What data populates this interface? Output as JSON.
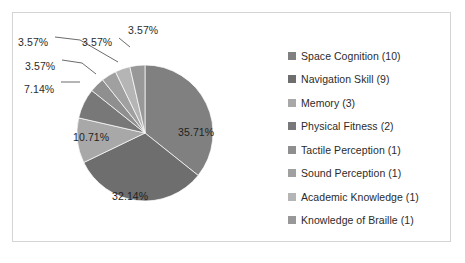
{
  "chart_data": {
    "type": "pie",
    "title": "",
    "subtitle": "",
    "xlabel": "",
    "ylabel": "",
    "legend_position": "right",
    "grid": false,
    "categories": [
      "Space Cognition",
      "Navigation Skill",
      "Memory",
      "Physical Fitness",
      "Tactile Perception",
      "Sound Perception",
      "Academic Knowledge",
      "Knowledge of Braille"
    ],
    "values": [
      10,
      9,
      3,
      2,
      1,
      1,
      1,
      1
    ],
    "percentages": [
      35.71,
      32.14,
      10.71,
      7.14,
      3.57,
      3.57,
      3.57,
      3.57
    ],
    "total": 28,
    "data_labels": [
      "35.71%",
      "32.14%",
      "10.71%",
      "7.14%",
      "3.57%",
      "3.57%",
      "3.57%",
      "3.57%"
    ],
    "colors": [
      "#808080",
      "#6e6e6e",
      "#a8a8a8",
      "#787878",
      "#8f8f8f",
      "#a0a0a0",
      "#b5b5b5",
      "#989898"
    ]
  },
  "legend": {
    "items": [
      {
        "label": "Space Cognition (10)",
        "color": "#808080"
      },
      {
        "label": "Navigation Skill (9)",
        "color": "#6e6e6e"
      },
      {
        "label": "Memory (3)",
        "color": "#a8a8a8"
      },
      {
        "label": "Physical Fitness (2)",
        "color": "#787878"
      },
      {
        "label": "Tactile Perception (1)",
        "color": "#8f8f8f"
      },
      {
        "label": "Sound Perception (1)",
        "color": "#a0a0a0"
      },
      {
        "label": "Academic Knowledge (1)",
        "color": "#b5b5b5"
      },
      {
        "label": "Knowledge of Braille (1)",
        "color": "#989898"
      }
    ]
  },
  "labels": {
    "inside": [
      {
        "text": "35.71%",
        "left": 178,
        "top": 126
      },
      {
        "text": "32.14%",
        "left": 112,
        "top": 190
      },
      {
        "text": "10.71%",
        "left": 73,
        "top": 131
      }
    ],
    "outside": [
      {
        "text": "7.14%",
        "left": 24,
        "top": 83
      },
      {
        "text": "3.57%",
        "left": 25,
        "top": 60
      },
      {
        "text": "3.57%",
        "left": 18,
        "top": 36
      },
      {
        "text": "3.57%",
        "left": 82,
        "top": 36
      },
      {
        "text": "3.57%",
        "left": 128,
        "top": 24
      }
    ]
  },
  "frame": {
    "border_color": "#d4d4d4",
    "background": "#ffffff"
  }
}
